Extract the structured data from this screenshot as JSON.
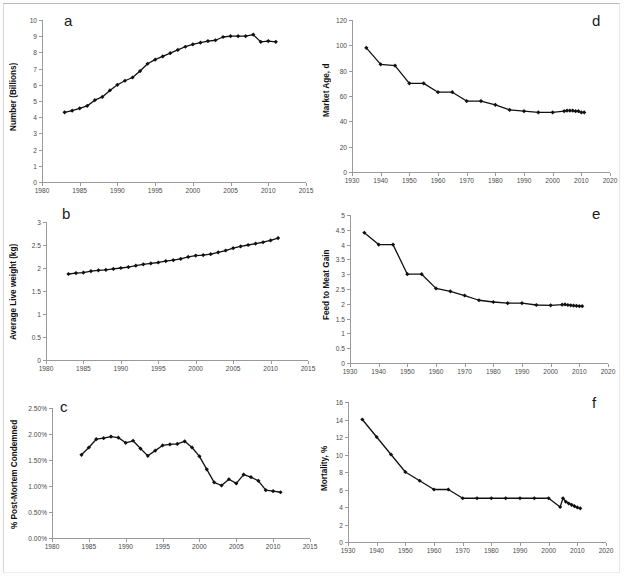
{
  "figure": {
    "background": "#ffffff",
    "series_color": "#111111",
    "axis_color": "#9a9a9a"
  },
  "panels": [
    {
      "id": "a",
      "letter": "a",
      "ylabel": "Number (Billions)",
      "chart_data": {
        "type": "line",
        "title": "",
        "xlabel": "",
        "ylabel": "Number (Billions)",
        "xlim": [
          1980,
          2015
        ],
        "ylim": [
          0,
          10
        ],
        "xticks": [
          1980,
          1985,
          1990,
          1995,
          2000,
          2005,
          2010,
          2015
        ],
        "yticks": [
          0,
          1,
          2,
          3,
          4,
          5,
          6,
          7,
          8,
          9,
          10
        ],
        "ytick_labels": [
          "0",
          "1",
          "2",
          "3",
          "4",
          "5",
          "6",
          "7",
          "8",
          "9",
          "10"
        ],
        "grid": false,
        "legend": "none",
        "x": [
          1983,
          1984,
          1985,
          1986,
          1987,
          1988,
          1989,
          1990,
          1991,
          1992,
          1993,
          1994,
          1995,
          1996,
          1997,
          1998,
          1999,
          2000,
          2001,
          2002,
          2003,
          2004,
          2005,
          2006,
          2007,
          2008,
          2009,
          2010,
          2011
        ],
        "values": [
          4.3,
          4.4,
          4.55,
          4.7,
          5.05,
          5.25,
          5.65,
          6.0,
          6.25,
          6.45,
          6.85,
          7.3,
          7.55,
          7.75,
          7.95,
          8.15,
          8.35,
          8.5,
          8.6,
          8.7,
          8.75,
          8.95,
          9.0,
          9.0,
          9.0,
          9.1,
          8.65,
          8.7,
          8.65
        ]
      }
    },
    {
      "id": "b",
      "letter": "b",
      "ylabel": "Average Live weight (kg)",
      "chart_data": {
        "type": "line",
        "title": "",
        "xlabel": "",
        "ylabel": "Average Live weight (kg)",
        "xlim": [
          1980,
          2015
        ],
        "ylim": [
          0,
          3
        ],
        "xticks": [
          1980,
          1985,
          1990,
          1995,
          2000,
          2005,
          2010,
          2015
        ],
        "yticks": [
          0,
          0.5,
          1,
          1.5,
          2,
          2.5,
          3
        ],
        "ytick_labels": [
          "0",
          "0.5",
          "1",
          "1.5",
          "2",
          "2.5",
          "3"
        ],
        "grid": false,
        "legend": "none",
        "x": [
          1983,
          1984,
          1985,
          1986,
          1987,
          1988,
          1989,
          1990,
          1991,
          1992,
          1993,
          1994,
          1995,
          1996,
          1997,
          1998,
          1999,
          2000,
          2001,
          2002,
          2003,
          2004,
          2005,
          2006,
          2007,
          2008,
          2009,
          2010,
          2011
        ],
        "values": [
          1.87,
          1.89,
          1.9,
          1.93,
          1.95,
          1.96,
          1.98,
          2.0,
          2.02,
          2.05,
          2.08,
          2.1,
          2.12,
          2.15,
          2.17,
          2.2,
          2.24,
          2.27,
          2.28,
          2.3,
          2.34,
          2.38,
          2.43,
          2.47,
          2.5,
          2.53,
          2.56,
          2.6,
          2.65
        ]
      }
    },
    {
      "id": "c",
      "letter": "c",
      "ylabel": "% Post-Mortem Condemned",
      "chart_data": {
        "type": "line",
        "title": "",
        "xlabel": "",
        "ylabel": "% Post-Mortem Condemned",
        "xlim": [
          1980,
          2015
        ],
        "ylim": [
          0,
          2.5
        ],
        "xticks": [
          1980,
          1985,
          1990,
          1995,
          2000,
          2005,
          2010,
          2015
        ],
        "yticks": [
          0,
          0.5,
          1.0,
          1.5,
          2.0,
          2.5
        ],
        "ytick_labels": [
          "0.00%",
          "0.50%",
          "1.00%",
          "1.50%",
          "2.00%",
          "2.50%"
        ],
        "grid": false,
        "legend": "none",
        "x": [
          1984,
          1985,
          1986,
          1987,
          1988,
          1989,
          1990,
          1991,
          1992,
          1993,
          1994,
          1995,
          1996,
          1997,
          1998,
          1999,
          2000,
          2001,
          2002,
          2003,
          2004,
          2005,
          2006,
          2007,
          2008,
          2009,
          2010,
          2011
        ],
        "values": [
          1.6,
          1.74,
          1.9,
          1.92,
          1.95,
          1.93,
          1.83,
          1.87,
          1.72,
          1.58,
          1.68,
          1.78,
          1.8,
          1.81,
          1.86,
          1.74,
          1.57,
          1.32,
          1.07,
          1.01,
          1.13,
          1.05,
          1.22,
          1.17,
          1.1,
          0.92,
          0.9,
          0.88
        ]
      }
    },
    {
      "id": "d",
      "letter": "d",
      "ylabel": "Market Age, d",
      "chart_data": {
        "type": "line",
        "title": "",
        "xlabel": "",
        "ylabel": "Market Age, d",
        "xlim": [
          1930,
          2020
        ],
        "ylim": [
          0,
          120
        ],
        "xticks": [
          1930,
          1940,
          1950,
          1960,
          1970,
          1980,
          1990,
          2000,
          2010,
          2020
        ],
        "yticks": [
          0,
          20,
          40,
          60,
          80,
          100,
          120
        ],
        "ytick_labels": [
          "0",
          "20",
          "40",
          "60",
          "80",
          "100",
          "120"
        ],
        "grid": false,
        "legend": "none",
        "x": [
          1935,
          1940,
          1945,
          1950,
          1955,
          1960,
          1965,
          1970,
          1975,
          1980,
          1985,
          1990,
          1995,
          2000,
          2004,
          2005,
          2006,
          2007,
          2008,
          2009,
          2010,
          2011
        ],
        "values": [
          98,
          85,
          84,
          70,
          70,
          63,
          63,
          56,
          56,
          53,
          49,
          48,
          47,
          47,
          48,
          48.5,
          48.5,
          48.5,
          48,
          48,
          47,
          47
        ]
      }
    },
    {
      "id": "e",
      "letter": "e",
      "ylabel": "Feed to Meat Gain",
      "chart_data": {
        "type": "line",
        "title": "",
        "xlabel": "",
        "ylabel": "Feed to Meat Gain",
        "xlim": [
          1930,
          2020
        ],
        "ylim": [
          0,
          5
        ],
        "xticks": [
          1930,
          1940,
          1950,
          1960,
          1970,
          1980,
          1990,
          2000,
          2010,
          2020
        ],
        "yticks": [
          0,
          0.5,
          1,
          1.5,
          2,
          2.5,
          3,
          3.5,
          4,
          4.5,
          5
        ],
        "ytick_labels": [
          "0",
          "0.5",
          "1",
          "1.5",
          "2",
          "2.5",
          "3",
          "3.5",
          "4",
          "4.5",
          "5"
        ],
        "grid": false,
        "legend": "none",
        "x": [
          1935,
          1940,
          1945,
          1950,
          1955,
          1960,
          1965,
          1970,
          1975,
          1980,
          1985,
          1990,
          1995,
          2000,
          2004,
          2005,
          2006,
          2007,
          2008,
          2009,
          2010,
          2011
        ],
        "values": [
          4.4,
          4.0,
          4.0,
          3.0,
          3.0,
          2.52,
          2.42,
          2.28,
          2.12,
          2.06,
          2.02,
          2.02,
          1.96,
          1.95,
          1.97,
          1.98,
          1.96,
          1.95,
          1.94,
          1.93,
          1.92,
          1.92
        ]
      }
    },
    {
      "id": "f",
      "letter": "f",
      "ylabel": "Mortality, %",
      "chart_data": {
        "type": "line",
        "title": "",
        "xlabel": "",
        "ylabel": "Mortality, %",
        "xlim": [
          1930,
          2020
        ],
        "ylim": [
          0,
          16
        ],
        "xticks": [
          1930,
          1940,
          1950,
          1960,
          1970,
          1980,
          1990,
          2000,
          2010,
          2020
        ],
        "yticks": [
          0,
          2,
          4,
          6,
          8,
          10,
          12,
          14,
          16
        ],
        "ytick_labels": [
          "0",
          "2",
          "4",
          "6",
          "8",
          "10",
          "12",
          "14",
          "16"
        ],
        "grid": false,
        "legend": "none",
        "x": [
          1935,
          1940,
          1945,
          1950,
          1955,
          1960,
          1965,
          1970,
          1975,
          1980,
          1985,
          1990,
          1995,
          2000,
          2004,
          2005,
          2006,
          2007,
          2008,
          2009,
          2010,
          2011
        ],
        "values": [
          14.0,
          12.0,
          10.0,
          8.0,
          7.0,
          6.0,
          6.0,
          5.0,
          5.0,
          5.0,
          5.0,
          5.0,
          5.0,
          5.0,
          4.0,
          5.0,
          4.6,
          4.4,
          4.25,
          4.1,
          3.95,
          3.85
        ]
      }
    }
  ]
}
